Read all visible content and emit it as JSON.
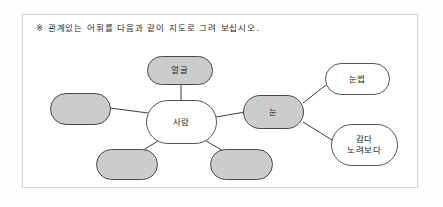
{
  "worksheet": {
    "instruction": "※ 관계있는 어휘를 다음과 같이 지도로 그려 보십시오."
  },
  "colors": {
    "filled_node": "#cccccc",
    "empty_node_fill": "#cccccc",
    "white_node": "#ffffff",
    "node_border": "#4a4a4a",
    "frame_border": "#d3d3d3",
    "text": "#1c1c1c",
    "page_background": "#ffffff"
  },
  "diagram": {
    "type": "word-web",
    "center": {
      "id": "center",
      "label": "사람",
      "filled": false
    },
    "nodes": [
      {
        "id": "node-face",
        "label": "얼굴",
        "filled": true,
        "empty": false
      },
      {
        "id": "node-left-blank",
        "label": "",
        "filled": true,
        "empty": true
      },
      {
        "id": "node-bottom-left-blank",
        "label": "",
        "filled": true,
        "empty": true
      },
      {
        "id": "node-bottom-right-blank",
        "label": "",
        "filled": true,
        "empty": true
      },
      {
        "id": "node-eye",
        "label": "눈",
        "filled": true,
        "empty": false
      },
      {
        "id": "node-eyebrow",
        "label": "눈썹",
        "filled": false,
        "empty": false
      },
      {
        "id": "node-verbs",
        "label": "감다\n노려보다",
        "filled": false,
        "empty": false
      }
    ],
    "edges": [
      {
        "from": "center",
        "to": "node-face"
      },
      {
        "from": "center",
        "to": "node-left-blank"
      },
      {
        "from": "center",
        "to": "node-bottom-left-blank"
      },
      {
        "from": "center",
        "to": "node-bottom-right-blank"
      },
      {
        "from": "center",
        "to": "node-eye"
      },
      {
        "from": "node-eye",
        "to": "node-eyebrow"
      },
      {
        "from": "node-eye",
        "to": "node-verbs"
      }
    ]
  }
}
